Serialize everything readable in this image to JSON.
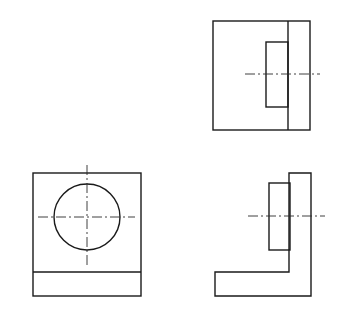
{
  "diagram": {
    "type": "orthographic-projection",
    "line_color": "#1a1a1a",
    "background": "#ffffff",
    "views": [
      {
        "name": "top-right-view",
        "outer_rect": {
          "x": 213,
          "y": 21,
          "w": 97,
          "h": 109
        },
        "divider_x": 288,
        "inner_rect": {
          "x": 266,
          "y": 42,
          "w": 22,
          "h": 65
        },
        "centerline": {
          "x1": 245,
          "y1": 74,
          "x2": 320,
          "y2": 74
        }
      },
      {
        "name": "bottom-left-view",
        "outer_rect": {
          "x": 33,
          "y": 173,
          "w": 108,
          "h": 123
        },
        "divider_y": 272,
        "circle": {
          "cx": 87,
          "cy": 217,
          "r": 33
        },
        "centerline_h": {
          "x1": 38,
          "y1": 217,
          "x2": 135,
          "y2": 217
        },
        "centerline_v": {
          "x1": 87,
          "y1": 165,
          "x2": 87,
          "y2": 265
        }
      },
      {
        "name": "bottom-right-view",
        "l_shape_points": "289,173 311,173 311,296 215,296 215,272 289,272",
        "boss_rect": {
          "x": 269,
          "y": 183,
          "w": 21,
          "h": 67
        },
        "centerline": {
          "x1": 248,
          "y1": 216,
          "x2": 325,
          "y2": 216
        }
      }
    ]
  }
}
